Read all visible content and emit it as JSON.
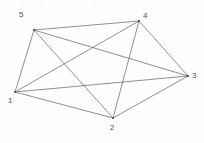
{
  "figure": {
    "background_color": "#fefefe",
    "edge_color": "#5f5f5f",
    "label_color": "#4e4e4e",
    "width": 204,
    "height": 143
  },
  "graph": {
    "type": "undirected-complete-graph",
    "vertex_count": 5,
    "edge_count": 10,
    "nodes": [
      {
        "id": "1",
        "label": "1",
        "x": 15,
        "y": 92,
        "label_x": 8,
        "label_y": 97
      },
      {
        "id": "2",
        "label": "2",
        "x": 113,
        "y": 118,
        "label_x": 110,
        "label_y": 124
      },
      {
        "id": "3",
        "label": "3",
        "x": 188,
        "y": 76,
        "label_x": 192,
        "label_y": 72
      },
      {
        "id": "4",
        "label": "4",
        "x": 139,
        "y": 21,
        "label_x": 143,
        "label_y": 12
      },
      {
        "id": "5",
        "label": "5",
        "x": 34,
        "y": 30,
        "label_x": 19,
        "label_y": 11
      }
    ],
    "edges": [
      {
        "from": "1",
        "to": "2"
      },
      {
        "from": "1",
        "to": "3"
      },
      {
        "from": "1",
        "to": "4"
      },
      {
        "from": "1",
        "to": "5"
      },
      {
        "from": "2",
        "to": "3"
      },
      {
        "from": "2",
        "to": "4"
      },
      {
        "from": "2",
        "to": "5"
      },
      {
        "from": "3",
        "to": "4"
      },
      {
        "from": "3",
        "to": "5"
      },
      {
        "from": "4",
        "to": "5"
      }
    ]
  }
}
